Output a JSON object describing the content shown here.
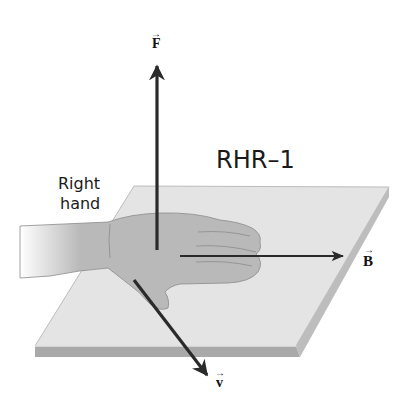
{
  "figure": {
    "title": "RHR–1",
    "hand_label_line1": "Right",
    "hand_label_line2": "hand",
    "vectors": {
      "force": {
        "symbol": "F",
        "arrow": "→",
        "direction": "up"
      },
      "field": {
        "symbol": "B",
        "arrow": "→",
        "direction": "right"
      },
      "velocity": {
        "symbol": "v",
        "arrow": "→",
        "direction": "down-right"
      }
    }
  },
  "colors": {
    "plate_top": "#e4e4e4",
    "plate_edge_front": "#a9a9a9",
    "plate_edge_side": "#bdbdbd",
    "hand": "#b9b9b9",
    "hand_outline": "#8a8a8a",
    "arrow": "#2a2a2a"
  }
}
